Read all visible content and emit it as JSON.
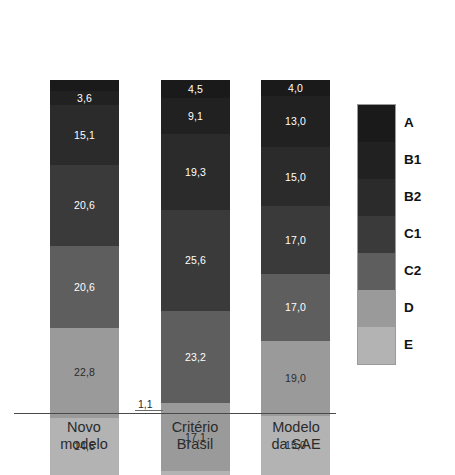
{
  "chart_data": {
    "type": "bar",
    "subtype": "stacked-bar-100-percent",
    "title": "",
    "subtitle": "",
    "xlabel": "",
    "ylabel": "",
    "ylim": [
      0,
      100
    ],
    "grid": false,
    "legend_position": "right",
    "categories": [
      "Novo modelo",
      "Critério Brasil",
      "Modelo da SAE"
    ],
    "series": [
      {
        "name": "A",
        "color": "#1a1a1a",
        "values": [
          2.8,
          4.5,
          4.0
        ],
        "labels": [
          "2,8",
          "4,5",
          "4,0"
        ]
      },
      {
        "name": "B1",
        "color": "#212121",
        "values": [
          3.6,
          9.1,
          13.0
        ],
        "labels": [
          "3,6",
          "9,1",
          "13,0"
        ]
      },
      {
        "name": "B2",
        "color": "#2b2b2b",
        "values": [
          15.1,
          19.3,
          15.0
        ],
        "labels": [
          "15,1",
          "19,3",
          "15,0"
        ]
      },
      {
        "name": "C1",
        "color": "#3a3a3a",
        "values": [
          20.6,
          25.6,
          17.0
        ],
        "labels": [
          "20,6",
          "25,6",
          "17,0"
        ]
      },
      {
        "name": "C2",
        "color": "#5e5e5e",
        "values": [
          20.6,
          23.2,
          17.0
        ],
        "labels": [
          "20,6",
          "23,2",
          "17,0"
        ]
      },
      {
        "name": "D",
        "color": "#9a9a9a",
        "values": [
          22.8,
          17.1,
          19.0
        ],
        "labels": [
          "22,8",
          "17,1",
          "19,0"
        ]
      },
      {
        "name": "E",
        "color": "#b3b3b3",
        "values": [
          14.5,
          1.1,
          15.0
        ],
        "labels": [
          "14,5",
          "1,1",
          "15,0"
        ]
      }
    ],
    "callouts": [
      {
        "text": "1,1",
        "category": "Critério Brasil",
        "series": "E"
      }
    ]
  },
  "legend": {
    "items": [
      {
        "label": "A",
        "color": "#1a1a1a"
      },
      {
        "label": "B1",
        "color": "#212121"
      },
      {
        "label": "B2",
        "color": "#2b2b2b"
      },
      {
        "label": "C1",
        "color": "#3a3a3a"
      },
      {
        "label": "C2",
        "color": "#5e5e5e"
      },
      {
        "label": "D",
        "color": "#9a9a9a"
      },
      {
        "label": "E",
        "color": "#b3b3b3"
      }
    ]
  },
  "axis": {
    "categories": [
      {
        "line1": "Novo",
        "line2": "modelo"
      },
      {
        "line1": "Critério",
        "line2": "Brasil"
      },
      {
        "line1": "Modelo",
        "line2": "da SAE"
      }
    ]
  }
}
